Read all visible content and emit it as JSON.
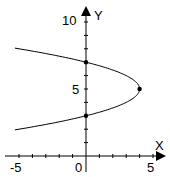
{
  "chart_data": {
    "type": "line",
    "title": "",
    "xlabel": "X",
    "ylabel": "Y",
    "xlim": [
      -5,
      5
    ],
    "ylim": [
      0,
      10
    ],
    "grid": false,
    "x_tick_labels": [
      "-5",
      "0",
      "5"
    ],
    "y_tick_labels": [
      "5",
      "10"
    ],
    "equation": "x = 4 - (y - 5)^2",
    "series": [
      {
        "name": "parabola",
        "points": [
          [
            -5,
            8
          ],
          [
            -3,
            7.65
          ],
          [
            0,
            7
          ],
          [
            2,
            6.41
          ],
          [
            3,
            6
          ],
          [
            4,
            5
          ],
          [
            3,
            4
          ],
          [
            2,
            3.59
          ],
          [
            0,
            3
          ],
          [
            -3,
            2.35
          ],
          [
            -5,
            2
          ]
        ]
      }
    ],
    "marked_points": [
      [
        0,
        7
      ],
      [
        4,
        5
      ],
      [
        0,
        3
      ]
    ]
  },
  "labels": {
    "x_axis": "X",
    "y_axis": "Y",
    "x_min": "-5",
    "x_origin": "0",
    "x_max": "5",
    "y_mid": "5",
    "y_max": "10"
  }
}
